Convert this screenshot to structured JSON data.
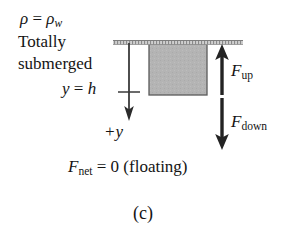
{
  "figure": {
    "caption": "(c)",
    "background_color": "#ffffff",
    "ink_color": "#141414"
  },
  "annotations": {
    "density_symbol": "ρ",
    "density_equals": " = ",
    "density_value_symbol": "ρ",
    "density_value_subscript": "w",
    "state_line1": "Totally",
    "state_line2": "submerged",
    "depth_symbol": "y",
    "depth_equals": " = ",
    "depth_value": "h",
    "axis_label": "+y"
  },
  "forces": {
    "up": {
      "symbol": "F",
      "subscript": "up",
      "direction": "up",
      "color": "#232323"
    },
    "down": {
      "symbol": "F",
      "subscript": "down",
      "direction": "down",
      "color": "#232323"
    },
    "net": {
      "symbol": "F",
      "subscript": "net",
      "equation": " = 0 (floating)"
    }
  },
  "objects": {
    "block": {
      "fill_color": "#b4b4b4",
      "stroke_color": "#5a5a5a"
    },
    "water_line": {
      "color": "#9a9a9a",
      "style": "hatched"
    },
    "axis": {
      "color": "#3a3a3a"
    }
  }
}
